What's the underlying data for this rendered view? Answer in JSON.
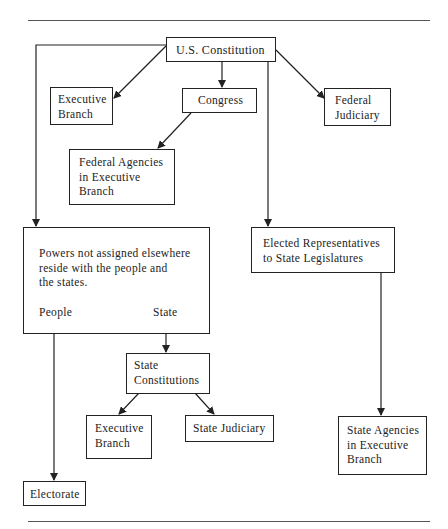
{
  "diagram": {
    "nodes": {
      "constitution": "U.S. Constitution",
      "fed_executive": "Executive\nBranch",
      "congress": "Congress",
      "fed_judiciary": "Federal\nJudiciary",
      "fed_agencies": "Federal Agencies\nin Executive\nBranch",
      "reserved_powers": "Powers not assigned elsewhere\nreside with the people and\nthe states.",
      "people_label": "People",
      "state_label": "State",
      "elected_reps": "Elected Representatives\nto State Legislatures",
      "state_constitutions": "State\nConstitutions",
      "state_executive": "Executive\nBranch",
      "state_judiciary": "State Judiciary",
      "state_agencies": "State Agencies\nin Executive\nBranch",
      "electorate": "Electorate"
    },
    "edges": [
      {
        "from": "constitution",
        "to": "fed_executive"
      },
      {
        "from": "constitution",
        "to": "congress"
      },
      {
        "from": "constitution",
        "to": "fed_judiciary"
      },
      {
        "from": "constitution",
        "to": "reserved_powers"
      },
      {
        "from": "constitution",
        "to": "elected_reps"
      },
      {
        "from": "congress",
        "to": "fed_agencies"
      },
      {
        "from": "state_label",
        "to": "state_constitutions"
      },
      {
        "from": "people_label",
        "to": "electorate"
      },
      {
        "from": "state_constitutions",
        "to": "state_executive"
      },
      {
        "from": "state_constitutions",
        "to": "state_judiciary"
      },
      {
        "from": "elected_reps",
        "to": "state_agencies"
      }
    ]
  }
}
